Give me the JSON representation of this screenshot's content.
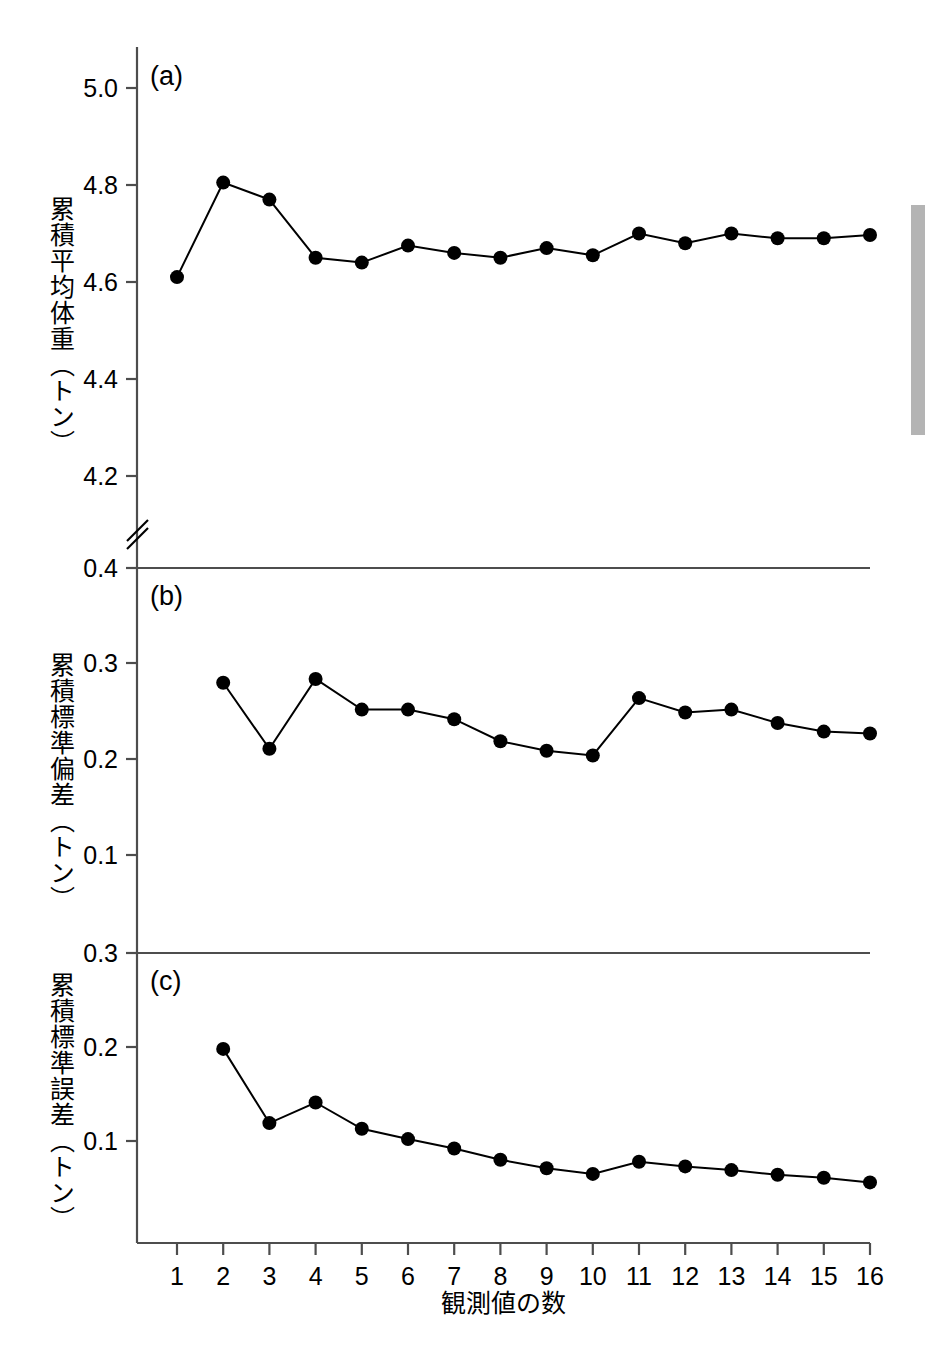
{
  "figure": {
    "xaxis_title": "観測値の数",
    "panels": [
      {
        "tag": "(a)",
        "ylabel": "累積平均体重（トン）",
        "yticks": [
          "5.0",
          "4.8",
          "4.6",
          "4.4",
          "4.2"
        ],
        "axis_break": true
      },
      {
        "tag": "(b)",
        "ylabel": "累積標準偏差（トン）",
        "yticks": [
          "0.4",
          "0.3",
          "0.2",
          "0.1"
        ],
        "axis_break": false
      },
      {
        "tag": "(c)",
        "ylabel": "累積標準誤差（トン）",
        "yticks": [
          "0.3",
          "0.2",
          "0.1"
        ],
        "axis_break": false
      }
    ],
    "xticks": [
      "1",
      "2",
      "3",
      "4",
      "5",
      "6",
      "7",
      "8",
      "9",
      "10",
      "11",
      "12",
      "13",
      "14",
      "15",
      "16"
    ],
    "marker_color": "#000000",
    "line_color": "#000000",
    "axis_color": "#4d4d4d",
    "scrollbar_color": "#b4b4b4"
  },
  "chart_data": [
    {
      "type": "line",
      "title": "(a)",
      "xlabel": "観測値の数",
      "ylabel": "累積平均体重（トン）",
      "x": [
        1,
        2,
        3,
        4,
        5,
        6,
        7,
        8,
        9,
        10,
        11,
        12,
        13,
        14,
        15,
        16
      ],
      "values": [
        4.61,
        4.805,
        4.77,
        4.65,
        4.64,
        4.675,
        4.66,
        4.65,
        4.67,
        4.655,
        4.7,
        4.68,
        4.7,
        4.69,
        4.69,
        4.697
      ],
      "ylim": [
        4.1,
        5.06
      ],
      "yticks": [
        5.0,
        4.8,
        4.6,
        4.4,
        4.2
      ],
      "xlim": [
        0.55,
        16.6
      ],
      "grid": false,
      "legend": false,
      "axis_break_y": true
    },
    {
      "type": "line",
      "title": "(b)",
      "xlabel": "観測値の数",
      "ylabel": "累積標準偏差（トン）",
      "x": [
        2,
        3,
        4,
        5,
        6,
        7,
        8,
        9,
        10,
        11,
        12,
        13,
        14,
        15,
        16
      ],
      "values": [
        0.28,
        0.211,
        0.284,
        0.252,
        0.252,
        0.242,
        0.219,
        0.209,
        0.204,
        0.264,
        0.249,
        0.252,
        0.238,
        0.229,
        0.227
      ],
      "ylim": [
        0.0,
        0.4
      ],
      "yticks": [
        0.4,
        0.3,
        0.2,
        0.1
      ],
      "xlim": [
        0.55,
        16.6
      ],
      "grid": false,
      "legend": false
    },
    {
      "type": "line",
      "title": "(c)",
      "xlabel": "観測値の数",
      "ylabel": "累積標準誤差（トン）",
      "x": [
        2,
        3,
        4,
        5,
        6,
        7,
        8,
        9,
        10,
        11,
        12,
        13,
        14,
        15,
        16
      ],
      "values": [
        0.198,
        0.119,
        0.141,
        0.113,
        0.102,
        0.092,
        0.08,
        0.071,
        0.065,
        0.078,
        0.073,
        0.069,
        0.064,
        0.061,
        0.056
      ],
      "ylim": [
        0.0,
        0.3
      ],
      "yticks": [
        0.3,
        0.2,
        0.1
      ],
      "xlim": [
        0.55,
        16.6
      ],
      "grid": false,
      "legend": false
    }
  ]
}
